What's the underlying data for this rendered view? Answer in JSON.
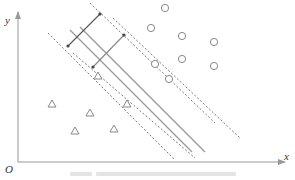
{
  "figure": {
    "type": "svm-hyperplane-diagram",
    "axes": {
      "x_label": "x",
      "y_label": "y",
      "origin_label": "O",
      "origin_px": [
        18,
        162
      ],
      "x_end_px": [
        285,
        162
      ],
      "y_end_px": [
        18,
        12
      ],
      "axis_color": "#999999"
    },
    "hyperplanes": [
      {
        "name": "hyperplane-a",
        "style": "solid",
        "from": [
          70,
          30
        ],
        "to": [
          192,
          152
        ]
      },
      {
        "name": "hyperplane-b",
        "style": "solid",
        "from": [
          80,
          27
        ],
        "to": [
          205,
          152
        ]
      }
    ],
    "margin_lines": [
      {
        "name": "margin-a-upper",
        "style": "dashed",
        "from": [
          90,
          3
        ],
        "to": [
          215,
          123
        ]
      },
      {
        "name": "margin-a-lower",
        "style": "dashed",
        "from": [
          48,
          33
        ],
        "to": [
          175,
          160
        ]
      },
      {
        "name": "margin-b-upper",
        "style": "dashed",
        "from": [
          113,
          18
        ],
        "to": [
          240,
          138
        ]
      },
      {
        "name": "margin-b-lower",
        "style": "dashed",
        "from": [
          73,
          53
        ],
        "to": [
          195,
          158
        ]
      }
    ],
    "margin_arrows": [
      {
        "name": "margin-arrow-a",
        "from": [
          68,
          46
        ],
        "to": [
          100,
          14
        ],
        "color": "#555555"
      },
      {
        "name": "margin-arrow-b",
        "from": [
          93,
          67
        ],
        "to": [
          124,
          35
        ],
        "color": "#888888"
      }
    ],
    "positive_points": [
      [
        165,
        8
      ],
      [
        151,
        28
      ],
      [
        182,
        36
      ],
      [
        214,
        42
      ],
      [
        182,
        59
      ],
      [
        214,
        66
      ],
      [
        155,
        64
      ],
      [
        169,
        79
      ]
    ],
    "negative_points": [
      [
        52,
        104
      ],
      [
        90,
        113
      ],
      [
        127,
        104
      ],
      [
        75,
        131
      ],
      [
        114,
        129
      ],
      [
        98,
        76
      ]
    ],
    "point_color": "#888888",
    "line_color": "#888888"
  },
  "caption": {
    "text": "",
    "note": "caption present but illegible",
    "color": "#dddddd"
  }
}
